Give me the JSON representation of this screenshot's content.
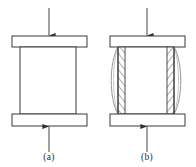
{
  "figure": {
    "background_color": "#ffffff",
    "line_color": "#3a3a3a",
    "hatch_color": "#4a4a4a",
    "bulge_color": "#8c8c8c",
    "plate_fill": "#ffffff",
    "specimen_fill": "#ffffff",
    "width": 196,
    "height": 167
  },
  "panels": [
    {
      "id": "a",
      "label": "(a)",
      "description": "undeformed cylindrical specimen between two platens",
      "platen_top": {
        "x": 12,
        "y": 36,
        "width": 75,
        "height": 11
      },
      "platen_bottom": {
        "x": 12,
        "y": 114,
        "width": 75,
        "height": 12
      },
      "specimen": {
        "x": 20,
        "y": 47,
        "width": 56,
        "height": 67
      },
      "arrow_top": {
        "x": 49,
        "y_start": 8,
        "y_end": 36,
        "direction": "down"
      },
      "arrow_bottom": {
        "x": 49,
        "y_start": 152,
        "y_end": 126,
        "direction": "up"
      },
      "label_x": 49,
      "label_y": 158,
      "has_barreling": false,
      "has_hatching": false
    },
    {
      "id": "b",
      "label": "(b)",
      "description": "barreled specimen after compression with hatched friction zones at the ends",
      "platen_top": {
        "x": 110,
        "y": 36,
        "width": 75,
        "height": 11
      },
      "platen_bottom": {
        "x": 110,
        "y": 114,
        "width": 75,
        "height": 12
      },
      "specimen": {
        "x": 118,
        "y": 47,
        "width": 56,
        "height": 67
      },
      "arrow_top": {
        "x": 147,
        "y_start": 8,
        "y_end": 36,
        "direction": "down"
      },
      "arrow_bottom": {
        "x": 147,
        "y_start": 152,
        "y_end": 126,
        "direction": "up"
      },
      "label_x": 147,
      "label_y": 158,
      "has_barreling": true,
      "has_hatching": true,
      "bulge_amplitude": 8,
      "hatch_band_width": 7,
      "hatch_line_count": 13
    }
  ],
  "annotations": {
    "load_arrow_name": "applied compressive load",
    "hatch_region_name": "dead metal / friction zone",
    "bulge_name": "barreled profile"
  }
}
